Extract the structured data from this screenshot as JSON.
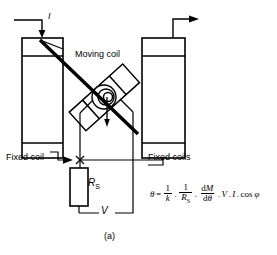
{
  "figure": {
    "caption": "(a)",
    "type": "electrodynamometer-wattmeter-schematic"
  },
  "labels": {
    "moving_coil": "Moving coil",
    "fixed_coil": "Fixed coil",
    "fixed_coils": "Fixed coils",
    "current": "I",
    "series_resistor": "R",
    "series_resistor_sub": "S",
    "voltage": "V"
  },
  "equation": {
    "lhs": "θ",
    "equals": "=",
    "term1_num": "1",
    "term1_den": "k",
    "dot1": ".",
    "term2_num": "1",
    "term2_den": "R",
    "term2_den_sub": "S",
    "dot2": ".",
    "term3_num_d": "d",
    "term3_num_M": "M",
    "term3_den_d": "d",
    "term3_den_theta": "θ",
    "dot3": ".",
    "term4": "V",
    "dot4": ".",
    "term5": "I",
    "dot5": ".",
    "term6": "cos",
    "term7": "φ",
    "plain": "θ = 1/k . 1/R_S . dM/dθ . V . I . cos φ"
  },
  "colors": {
    "stroke": "#000000",
    "background": "#ffffff"
  }
}
